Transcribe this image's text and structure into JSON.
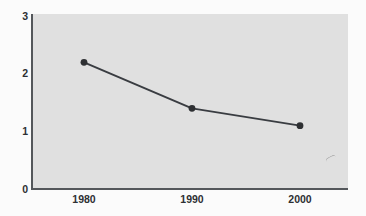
{
  "chart_data": {
    "type": "line",
    "title": "",
    "subtitle": "",
    "xlabel": "",
    "ylabel": "",
    "x": [
      1980,
      1990,
      2000
    ],
    "categories": [
      "1980",
      "1990",
      "2000"
    ],
    "values": [
      2.2,
      1.4,
      1.1
    ],
    "series": [
      {
        "name": "",
        "values": [
          2.2,
          1.4,
          1.1
        ]
      }
    ],
    "xtick_labels": [
      "1980",
      "1990",
      "2000"
    ],
    "ytick_labels": [
      "0",
      "1",
      "2",
      "3"
    ],
    "ytick_values": [
      0,
      1,
      2,
      3
    ],
    "ylim": [
      0,
      3
    ],
    "grid": false,
    "legend": false,
    "legend_position": "none",
    "annotations": [],
    "colors": {
      "line": "#3a3d42",
      "marker": "#2e3033",
      "plot_background": "#e2e2e2",
      "figure_background": "#fdfdfd",
      "axis": "#55585c",
      "tick_text": "#2e3033"
    }
  },
  "axes": {
    "y_ticks": [
      {
        "label": "3",
        "value": 3
      },
      {
        "label": "2",
        "value": 2
      },
      {
        "label": "1",
        "value": 1
      },
      {
        "label": "0",
        "value": 0
      }
    ],
    "x_ticks": [
      {
        "label": "1980",
        "value": 1980
      },
      {
        "label": "1990",
        "value": 1990
      },
      {
        "label": "2000",
        "value": 2000
      }
    ]
  }
}
